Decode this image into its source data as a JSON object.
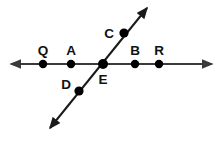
{
  "diagram": {
    "type": "geometry-line-diagram",
    "canvas": {
      "width": 221,
      "height": 144
    },
    "colors": {
      "background": "#ffffff",
      "line": "#3a3a3a",
      "diagonal_line": "#1a1a1a",
      "point": "#000000",
      "label": "#111111"
    },
    "lines": [
      {
        "name": "horizontal-line",
        "id": "line-QR",
        "kind": "double-arrow-line",
        "x1": 11,
        "y1": 64,
        "x2": 212,
        "y2": 64,
        "stroke": "#3a3a3a",
        "stroke_width": 2,
        "arrow_start": true,
        "arrow_end": true
      },
      {
        "name": "diagonal-line",
        "id": "line-CD",
        "kind": "double-arrow-line",
        "x1": 147,
        "y1": 8,
        "x2": 50,
        "y2": 128,
        "stroke": "#1a1a1a",
        "stroke_width": 2,
        "arrow_start": true,
        "arrow_end": true
      }
    ],
    "points": [
      {
        "id": "Q",
        "label": "Q",
        "cx": 43,
        "cy": 64,
        "r": 4.2,
        "label_x": 43,
        "label_y": 55,
        "label_pos": "above"
      },
      {
        "id": "A",
        "label": "A",
        "cx": 71,
        "cy": 64,
        "r": 4.2,
        "label_x": 71,
        "label_y": 55,
        "label_pos": "above"
      },
      {
        "id": "E",
        "label": "E",
        "cx": 103,
        "cy": 64,
        "r": 5.0,
        "label_x": 103,
        "label_y": 84,
        "label_pos": "below"
      },
      {
        "id": "B",
        "label": "B",
        "cx": 135,
        "cy": 64,
        "r": 4.2,
        "label_x": 135,
        "label_y": 55,
        "label_pos": "above"
      },
      {
        "id": "R",
        "label": "R",
        "cx": 159,
        "cy": 64,
        "r": 4.2,
        "label_x": 159,
        "label_y": 55,
        "label_pos": "above"
      },
      {
        "id": "C",
        "label": "C",
        "cx": 124,
        "cy": 33,
        "r": 4.6,
        "label_x": 109,
        "label_y": 38,
        "label_pos": "left"
      },
      {
        "id": "D",
        "label": "D",
        "cx": 79,
        "cy": 91,
        "r": 4.6,
        "label_x": 66,
        "label_y": 89,
        "label_pos": "left"
      }
    ],
    "arrowhead": {
      "name": "arrowhead-marker",
      "width": 5,
      "height": 4.5
    }
  }
}
